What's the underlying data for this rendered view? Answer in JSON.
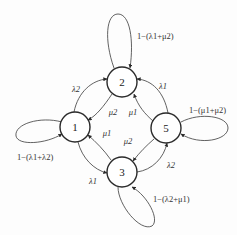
{
  "diagram": {
    "type": "state-transition-graph",
    "nodes": [
      {
        "id": "1",
        "label": "1"
      },
      {
        "id": "2",
        "label": "2"
      },
      {
        "id": "3",
        "label": "3"
      },
      {
        "id": "5",
        "label": "5"
      }
    ],
    "edges": [
      {
        "from": "1",
        "to": "2",
        "label": "λ2"
      },
      {
        "from": "5",
        "to": "2",
        "label": "λ1"
      },
      {
        "from": "2",
        "to": "1",
        "label": "μ2"
      },
      {
        "from": "2",
        "to": "5",
        "label": "μ1"
      },
      {
        "from": "3",
        "to": "1",
        "label": "μ1"
      },
      {
        "from": "5",
        "to": "3",
        "label": "μ2"
      },
      {
        "from": "1",
        "to": "3",
        "label": "λ1"
      },
      {
        "from": "3",
        "to": "5",
        "label": "λ2"
      }
    ],
    "self_loops": [
      {
        "node": "2",
        "label": "1−(λ1+μ2)"
      },
      {
        "node": "1",
        "label": "1−(λ1+λ2)"
      },
      {
        "node": "5",
        "label": "1−(μ1+μ2)"
      },
      {
        "node": "3",
        "label": "1−(λ2+μ1)"
      }
    ]
  }
}
